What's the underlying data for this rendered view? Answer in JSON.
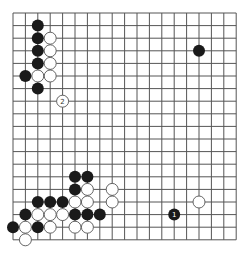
{
  "board": {
    "size": 19,
    "origin_x": 13,
    "origin_y": 13,
    "spacing_x": 12.4,
    "spacing_y": 12.6,
    "stone_radius": 6,
    "line_color": "#555555",
    "background": "#ffffff"
  },
  "stones": [
    {
      "color": "black",
      "col": 2,
      "row": 1
    },
    {
      "color": "black",
      "col": 2,
      "row": 2
    },
    {
      "color": "black",
      "col": 2,
      "row": 3
    },
    {
      "color": "black",
      "col": 2,
      "row": 4
    },
    {
      "color": "black",
      "col": 1,
      "row": 5
    },
    {
      "color": "black",
      "col": 2,
      "row": 6
    },
    {
      "color": "white",
      "col": 3,
      "row": 2
    },
    {
      "color": "white",
      "col": 3,
      "row": 3
    },
    {
      "color": "white",
      "col": 3,
      "row": 4
    },
    {
      "color": "white",
      "col": 2,
      "row": 5
    },
    {
      "color": "white",
      "col": 3,
      "row": 5
    },
    {
      "color": "white",
      "col": 4,
      "row": 7,
      "label": "2"
    },
    {
      "color": "black",
      "col": 15,
      "row": 3
    },
    {
      "color": "black",
      "col": 5,
      "row": 13
    },
    {
      "color": "black",
      "col": 6,
      "row": 13
    },
    {
      "color": "black",
      "col": 5,
      "row": 14
    },
    {
      "color": "white",
      "col": 6,
      "row": 14
    },
    {
      "color": "white",
      "col": 8,
      "row": 14
    },
    {
      "color": "black",
      "col": 2,
      "row": 15
    },
    {
      "color": "black",
      "col": 3,
      "row": 15
    },
    {
      "color": "black",
      "col": 4,
      "row": 15
    },
    {
      "color": "white",
      "col": 5,
      "row": 15
    },
    {
      "color": "white",
      "col": 6,
      "row": 15
    },
    {
      "color": "white",
      "col": 8,
      "row": 15
    },
    {
      "color": "black",
      "col": 1,
      "row": 16
    },
    {
      "color": "white",
      "col": 2,
      "row": 16
    },
    {
      "color": "white",
      "col": 3,
      "row": 16
    },
    {
      "color": "white",
      "col": 4,
      "row": 16
    },
    {
      "color": "black",
      "col": 5,
      "row": 16
    },
    {
      "color": "black",
      "col": 6,
      "row": 16
    },
    {
      "color": "black",
      "col": 7,
      "row": 16
    },
    {
      "color": "black",
      "col": 0,
      "row": 17
    },
    {
      "color": "white",
      "col": 1,
      "row": 17
    },
    {
      "color": "black",
      "col": 2,
      "row": 17
    },
    {
      "color": "white",
      "col": 3,
      "row": 17
    },
    {
      "color": "white",
      "col": 5,
      "row": 17
    },
    {
      "color": "white",
      "col": 6,
      "row": 17
    },
    {
      "color": "white",
      "col": 1,
      "row": 18
    },
    {
      "color": "white",
      "col": 15,
      "row": 15
    },
    {
      "color": "black",
      "col": 13,
      "row": 16,
      "label": "1"
    }
  ]
}
